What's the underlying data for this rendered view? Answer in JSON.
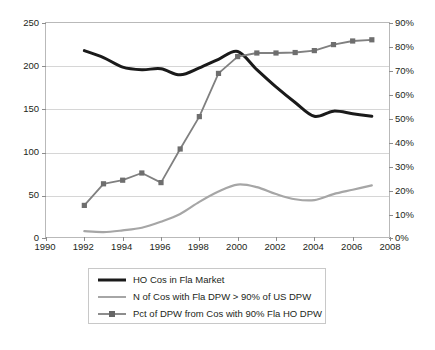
{
  "chart_data": {
    "type": "line",
    "title": "",
    "xlabel": "",
    "ylabel": "",
    "y2label": "",
    "x": [
      1992,
      1993,
      1994,
      1995,
      1996,
      1997,
      1998,
      1999,
      2000,
      2001,
      2002,
      2003,
      2004,
      2005,
      2006,
      2007
    ],
    "xlim": [
      1990,
      2008
    ],
    "ylim": [
      0,
      250
    ],
    "y2lim": [
      0,
      0.9
    ],
    "grid": true,
    "legend_position": "bottom",
    "xticks": [
      "1990",
      "1992",
      "1994",
      "1996",
      "1998",
      "2000",
      "2002",
      "2004",
      "2006",
      "2008"
    ],
    "yticks": [
      "0",
      "50",
      "100",
      "150",
      "200",
      "250"
    ],
    "y2ticks": [
      "0%",
      "10%",
      "20%",
      "30%",
      "40%",
      "50%",
      "60%",
      "70%",
      "80%",
      "90%"
    ],
    "series": [
      {
        "name": "HO Cos in Fla Market",
        "axis": "left",
        "color": "#1a1a1a",
        "markers": false,
        "values": [
          218,
          210,
          199,
          196,
          197,
          190,
          198,
          208,
          217,
          196,
          176,
          158,
          142,
          148,
          145,
          142
        ]
      },
      {
        "name": "N of Cos with Fla DPW > 90% of US DPW",
        "axis": "left",
        "color": "#a6a6a6",
        "markers": false,
        "values": [
          9,
          8,
          10,
          13,
          20,
          29,
          43,
          55,
          63,
          60,
          52,
          46,
          45,
          52,
          57,
          62
        ]
      },
      {
        "name": "Pct of DPW from Cos with 90% Fla HO DPW",
        "axis": "right",
        "color": "#808080",
        "markers": true,
        "values": [
          0.14,
          0.23,
          0.245,
          0.275,
          0.235,
          0.375,
          0.51,
          0.69,
          0.76,
          0.775,
          0.775,
          0.777,
          0.785,
          0.81,
          0.825,
          0.83
        ]
      }
    ]
  },
  "legend": {
    "entries": [
      {
        "label": "HO Cos in Fla Market",
        "swatch": "thick-black-line"
      },
      {
        "label": "N of Cos with Fla DPW > 90% of US DPW",
        "swatch": "thin-gray-line"
      },
      {
        "label": "Pct of DPW from Cos with 90% Fla HO DPW",
        "swatch": "gray-line-with-marker"
      }
    ]
  }
}
